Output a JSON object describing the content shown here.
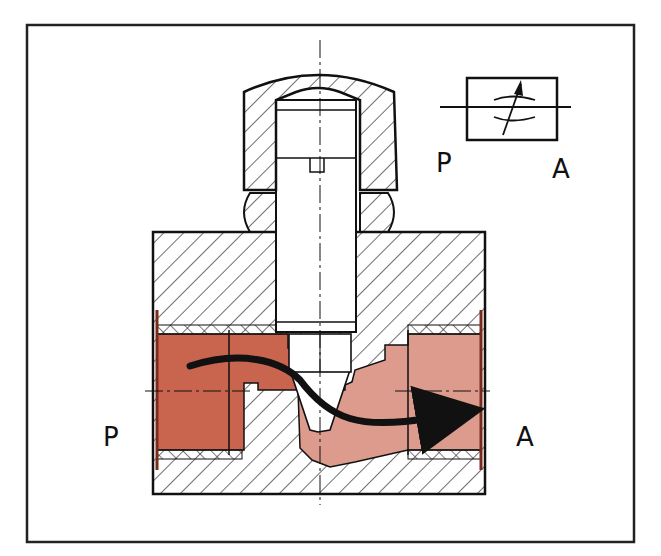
{
  "diagram": {
    "type": "cross-section",
    "labels": {
      "inlet": "P",
      "outlet": "A",
      "symbol_inlet": "P",
      "symbol_outlet": "A"
    },
    "colors": {
      "inlet_fluid": "#c9644f",
      "outlet_fluid": "#dc9b8c",
      "line": "#111111",
      "hatch": "#222222",
      "background": "#ffffff"
    },
    "parts": [
      "cap-nut",
      "lock-nut",
      "valve-body",
      "needle-spindle",
      "inlet-port",
      "outlet-port",
      "flow-arrow",
      "throttle-symbol"
    ]
  }
}
